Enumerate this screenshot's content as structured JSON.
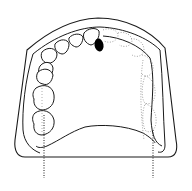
{
  "figure": {
    "title": "",
    "colors": {
      "stroke": "#1a1a1a",
      "dotted": "#9a9a9a",
      "marked_tooth": "#000000",
      "background": "#ffffff"
    },
    "elements": {
      "cast_base": "outer cast outline",
      "arch_ridge": "alveolar ridge outline",
      "palate": "palatal outline",
      "teeth_present": 7,
      "teeth_missing_outlines": 6,
      "marked_tooth": "filled black tooth",
      "reference_lines": [
        "left vertical dotted line",
        "right vertical dotted line"
      ]
    }
  }
}
